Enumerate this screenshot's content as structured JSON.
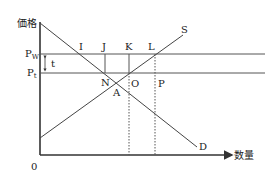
{
  "diagram": {
    "type": "supply-demand-tariff",
    "axes": {
      "y_label": "価格",
      "x_label": "数量",
      "origin": "0"
    },
    "price_levels": [
      {
        "id": "Pw",
        "base": "P",
        "sub": "W",
        "label": "Pw"
      },
      {
        "id": "Pt",
        "base": "P",
        "sub": "t",
        "label": "Pt"
      }
    ],
    "tariff_label": "t",
    "curves": {
      "supply": "S",
      "demand": "D"
    },
    "points": {
      "I": "I",
      "J": "J",
      "K": "K",
      "L": "L",
      "N": "N",
      "O": "O",
      "P": "P",
      "A": "A"
    },
    "colors": {
      "line": "#333333",
      "text": "#222222"
    }
  }
}
